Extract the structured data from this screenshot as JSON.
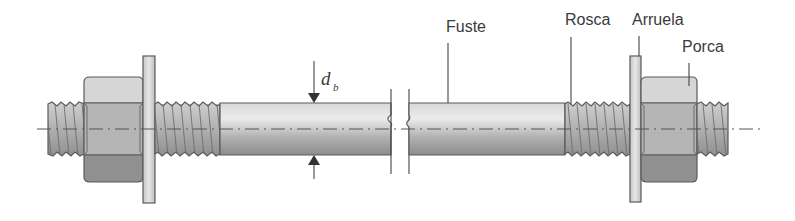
{
  "diagram": {
    "labels": {
      "shaft": "Fuste",
      "thread": "Rosca",
      "washer": "Arruela",
      "nut": "Porca",
      "diameter_symbol": "d",
      "diameter_subscript": "b"
    },
    "colors": {
      "background": "#ffffff",
      "shaft_light": "#e4e4e4",
      "shaft_dark": "#9c9c9c",
      "thread": "#b8b8b8",
      "washer": "#d6d6d6",
      "nut_top": "#d9d9d9",
      "nut_mid": "#b4b4b4",
      "nut_bottom": "#8e8e8e",
      "outline": "#5a5a5a",
      "text": "#3a3a3a"
    }
  }
}
